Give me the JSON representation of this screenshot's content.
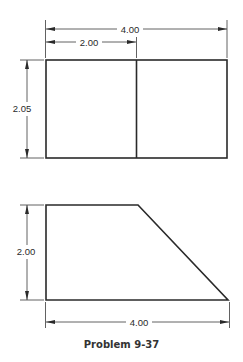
{
  "caption": "Problem 9-37",
  "top_view": {
    "overall_width_label": "4.00",
    "partial_width_label": "2.00",
    "height_label": "2.05"
  },
  "front_view": {
    "height_label": "2.00",
    "width_label": "4.00"
  },
  "colors": {
    "line": "#2a2a2a",
    "background": "#ffffff"
  }
}
